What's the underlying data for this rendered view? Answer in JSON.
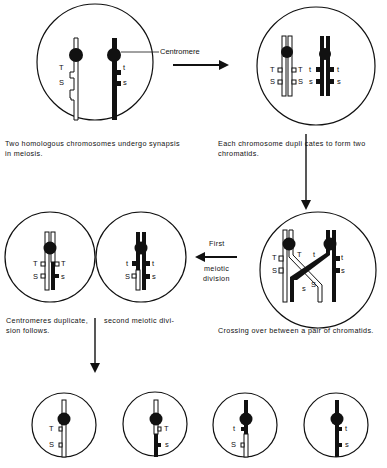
{
  "figure": {
    "colors": {
      "ink": "#111111",
      "paper": "#ffffff"
    },
    "labels": {
      "centromere": "Centromere",
      "first": "First",
      "meiotic": "meiotic",
      "division": "division"
    },
    "captions": {
      "step1_line1": "Two homologous chromosomes undergo synapsis",
      "step1_line2": "in meiosis.",
      "step2_line1": "Each chromosome dupli   cates to form two",
      "step2_line2": "chromatids.",
      "step3": "Crossing over between a pair of chromatids.",
      "step4_line1a": "Centromeres duplicate,",
      "step4_line1b": "second meiotic divi-",
      "step4_line2": "sion follows."
    },
    "genes": {
      "T": "T",
      "S": "S",
      "t": "t",
      "s": "s"
    },
    "gametes": [
      {
        "upper": "T",
        "lower": "S"
      },
      {
        "upper": "T",
        "lower": "s"
      },
      {
        "upper": "t",
        "lower": "S"
      },
      {
        "upper": "t",
        "lower": "s"
      }
    ]
  }
}
